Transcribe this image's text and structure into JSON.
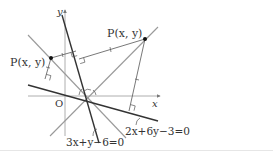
{
  "figure": {
    "axes": {
      "x_label": "x",
      "y_label": "y",
      "origin_label": "O"
    },
    "lines": [
      {
        "id": "line1",
        "equation": "3x+y−6=0",
        "style": "dark"
      },
      {
        "id": "line2",
        "equation": "2x+6y−3=0",
        "style": "dark"
      },
      {
        "id": "bisector-a",
        "equation": "",
        "style": "gray"
      },
      {
        "id": "bisector-b",
        "equation": "",
        "style": "gray"
      }
    ],
    "points": [
      {
        "id": "P-left",
        "label": "P(x, y)"
      },
      {
        "id": "P-right",
        "label": "P(x, y)"
      }
    ],
    "labels": {
      "line1_label": "3x+y−6=0",
      "line2_label": "2x+6y−3=0",
      "p_left": "P(x, y)",
      "p_right": "P(x, y)"
    },
    "colors": {
      "dark_line": "#333333",
      "gray_line": "#9a9a9a",
      "axis": "#888888",
      "text": "#333333"
    }
  }
}
